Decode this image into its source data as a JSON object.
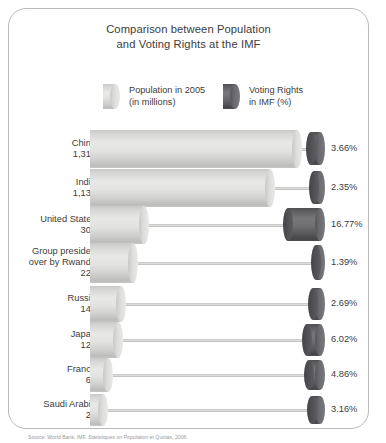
{
  "figure": {
    "title_line1": "Comparison between Population",
    "title_line2": "and Voting Rights at the IMF",
    "source": "Source: World Bank, IMF. Statistiques on Population et Quotas, 2006.",
    "colors": {
      "population_bar": "#dedede",
      "voting_bar": "#646469",
      "frame": "#b9b9b9",
      "text": "#3c3c3c",
      "background": "#ffffff"
    }
  },
  "legend": {
    "population": {
      "label_line1": "Population in 2005",
      "label_line2": "(in millions)",
      "swatch": "light-cylinder-swatch"
    },
    "voting": {
      "label_line1": "Voting Rights",
      "label_line2": "in IMF (%)",
      "swatch": "dark-cylinder-swatch"
    }
  },
  "chart_data": {
    "type": "bar",
    "title": "Comparison between Population and Voting Rights at the IMF",
    "xlabel": "",
    "ylabel": "",
    "orientation": "horizontal",
    "grid": false,
    "legend_position": "top",
    "categories": [
      "China",
      "India",
      "United States",
      "Group presided over by Rwanda",
      "Russia",
      "Japan",
      "France",
      "Saudi Arabia"
    ],
    "series": [
      {
        "name": "Population in 2005 (in millions)",
        "unit": "millions",
        "color": "#dedede",
        "values": [
          1313,
          1134,
          300,
          225,
          144,
          128,
          61,
          24
        ],
        "value_labels": [
          "1,313",
          "1,134",
          "300",
          "225",
          "144",
          "128",
          "61",
          "24"
        ]
      },
      {
        "name": "Voting Rights in IMF (%)",
        "unit": "%",
        "color": "#646469",
        "values": [
          3.66,
          2.35,
          16.77,
          1.39,
          2.69,
          6.02,
          4.86,
          3.16
        ],
        "value_labels": [
          "3.66%",
          "2.35%",
          "16.77%",
          "1.39%",
          "2.69%",
          "6.02%",
          "4.86%",
          "3.16%"
        ]
      }
    ],
    "rows": [
      {
        "name": "China",
        "name_lines": [
          "China"
        ],
        "population": 1313,
        "population_label": "1,313",
        "voting": 3.66,
        "voting_label": "3.66%"
      },
      {
        "name": "India",
        "name_lines": [
          "India"
        ],
        "population": 1134,
        "population_label": "1,134",
        "voting": 2.35,
        "voting_label": "2.35%"
      },
      {
        "name": "United States",
        "name_lines": [
          "United States"
        ],
        "population": 300,
        "population_label": "300",
        "voting": 16.77,
        "voting_label": "16.77%"
      },
      {
        "name": "Group presided over by Rwanda",
        "name_lines": [
          "Group presided",
          "over by Rwanda"
        ],
        "population": 225,
        "population_label": "225",
        "voting": 1.39,
        "voting_label": "1.39%"
      },
      {
        "name": "Russia",
        "name_lines": [
          "Russia"
        ],
        "population": 144,
        "population_label": "144",
        "voting": 2.69,
        "voting_label": "2.69%"
      },
      {
        "name": "Japan",
        "name_lines": [
          "Japan"
        ],
        "population": 128,
        "population_label": "128",
        "voting": 6.02,
        "voting_label": "6.02%"
      },
      {
        "name": "France",
        "name_lines": [
          "France"
        ],
        "population": 61,
        "population_label": "61",
        "voting": 4.86,
        "voting_label": "4.86%"
      },
      {
        "name": "Saudi Arabia",
        "name_lines": [
          "Saudi Arabia"
        ],
        "population": 24,
        "population_label": "24",
        "voting": 3.16,
        "voting_label": "3.16%"
      }
    ]
  },
  "layout": {
    "row_tops": [
      130,
      169,
      206,
      243,
      286,
      322,
      358,
      394
    ],
    "row_heights": [
      38,
      38,
      38,
      40,
      36,
      36,
      34,
      32
    ],
    "bar_left": 90,
    "pop_max_px": 212,
    "pop_min_px": 14,
    "vote_right": 325,
    "vote_max_px": 37,
    "vote_min_px": 7
  }
}
